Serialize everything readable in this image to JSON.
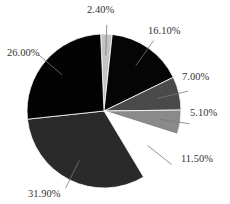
{
  "chart_data": {
    "type": "pie",
    "title": "",
    "start_angle_deg": -2.5,
    "direction": "clockwise",
    "center": [
      104,
      111
    ],
    "radius": 77,
    "slices": [
      {
        "label": "2.40%",
        "value": 2.4,
        "color": "#c4c4c4"
      },
      {
        "label": "16.10%",
        "value": 16.1,
        "color": "#050505"
      },
      {
        "label": "7.00%",
        "value": 7.0,
        "color": "#4a4a4a"
      },
      {
        "label": "5.10%",
        "value": 5.1,
        "color": "#8a8a8a"
      },
      {
        "label": "11.50%",
        "value": 11.5,
        "color": "#ffffff"
      },
      {
        "label": "31.90%",
        "value": 31.9,
        "color": "#2a2a2a"
      },
      {
        "label": "26.00%",
        "value": 26.0,
        "color": "#030303"
      }
    ],
    "legend": "none",
    "labels": [
      {
        "text": "2.40%",
        "x": 87,
        "y": 5
      },
      {
        "text": "16.10%",
        "x": 148,
        "y": 26
      },
      {
        "text": "7.00%",
        "x": 182,
        "y": 72
      },
      {
        "text": "5.10%",
        "x": 190,
        "y": 108
      },
      {
        "text": "11.50%",
        "x": 181,
        "y": 154
      },
      {
        "text": "31.90%",
        "x": 28,
        "y": 189
      },
      {
        "text": "26.00%",
        "x": 7,
        "y": 48
      }
    ]
  }
}
